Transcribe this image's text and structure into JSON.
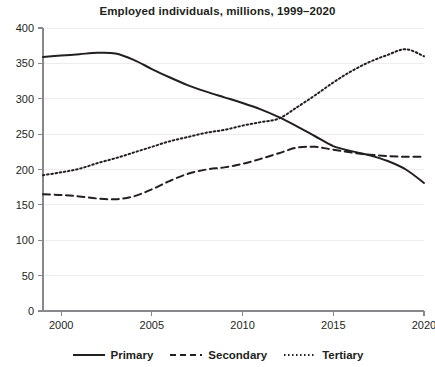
{
  "chart_data": {
    "type": "line",
    "title": "Employed individuals, millions, 1999–2020",
    "xlabel": "",
    "ylabel": "",
    "xlim": [
      1999,
      2020
    ],
    "ylim": [
      0,
      400
    ],
    "ytick_values": [
      0,
      50,
      100,
      150,
      200,
      250,
      300,
      350,
      400
    ],
    "ytick_labels": [
      "0",
      "50",
      "100",
      "150",
      "200",
      "250",
      "300",
      "350",
      "400"
    ],
    "xtick_values": [
      2000,
      2005,
      2010,
      2015,
      2020
    ],
    "xtick_labels": [
      "2000",
      "2005",
      "2010",
      "2015",
      "2020"
    ],
    "grid": "horizontal",
    "legend_position": "bottom",
    "x": [
      1999,
      2000,
      2001,
      2002,
      2003,
      2004,
      2005,
      2006,
      2007,
      2008,
      2009,
      2010,
      2011,
      2012,
      2013,
      2014,
      2015,
      2016,
      2017,
      2018,
      2019,
      2020
    ],
    "series": [
      {
        "name": "Primary",
        "style": "solid",
        "color": "#231f20",
        "values": [
          359,
          361,
          363,
          365,
          364,
          355,
          342,
          330,
          319,
          310,
          302,
          294,
          285,
          274,
          261,
          247,
          233,
          226,
          220,
          212,
          200,
          181
        ]
      },
      {
        "name": "Secondary",
        "style": "dashed",
        "color": "#231f20",
        "values": [
          165,
          164,
          162,
          159,
          158,
          162,
          172,
          184,
          194,
          200,
          203,
          208,
          215,
          223,
          231,
          232,
          228,
          224,
          221,
          219,
          218,
          218
        ]
      },
      {
        "name": "Tertiary",
        "style": "dotted",
        "color": "#231f20",
        "values": [
          192,
          196,
          201,
          209,
          216,
          224,
          232,
          240,
          246,
          252,
          256,
          262,
          267,
          272,
          288,
          305,
          323,
          339,
          352,
          362,
          370,
          360
        ]
      }
    ]
  },
  "legend": {
    "items": [
      {
        "label": "Primary",
        "style": "solid"
      },
      {
        "label": "Secondary",
        "style": "dashed"
      },
      {
        "label": "Tertiary",
        "style": "dotted"
      }
    ]
  }
}
